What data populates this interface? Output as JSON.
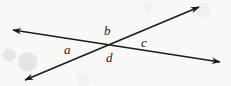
{
  "figure": {
    "name": "two-intersecting-lines-angle-diagram",
    "background_color": "#f8f8f7",
    "ink_color": "#1b1b1b",
    "width": 231,
    "height": 86,
    "intersection_point": {
      "x": 112,
      "y": 45
    },
    "lines": [
      {
        "id": "line-descending",
        "description": "line falling from upper-left to lower-right",
        "from": {
          "x": 13,
          "y": 30
        },
        "to": {
          "x": 220,
          "y": 62
        },
        "arrow_start": true,
        "arrow_end": true
      },
      {
        "id": "line-ascending",
        "description": "line rising from lower-left to upper-right",
        "from": {
          "x": 25,
          "y": 80
        },
        "to": {
          "x": 199,
          "y": 7
        },
        "arrow_start": true,
        "arrow_end": true
      }
    ],
    "labels": {
      "a": "a",
      "b": "b",
      "c": "c",
      "d": "d"
    }
  }
}
